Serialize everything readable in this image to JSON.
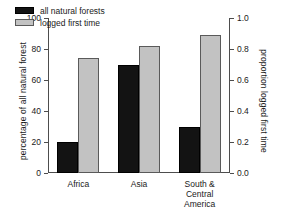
{
  "chart_data": {
    "type": "bar",
    "title": "",
    "categories": [
      "Africa",
      "Asia",
      "South &\nCentral America"
    ],
    "series": [
      {
        "name": "all natural forests",
        "color": "#131313",
        "values": [
          20,
          70,
          30
        ]
      },
      {
        "name": "logged first time",
        "color": "#c2c2c2",
        "values": [
          74,
          82,
          89
        ]
      }
    ],
    "xlabel": "",
    "ylabel": "percentage of all natural forest",
    "ylabel_right": "proportion logged first time",
    "ylim": [
      0,
      100
    ],
    "ylim_right": [
      0.0,
      1.0
    ],
    "yticks": [
      "0",
      "20",
      "40",
      "60",
      "80",
      "100"
    ],
    "ytick_values": [
      0,
      20,
      40,
      60,
      80,
      100
    ],
    "yticks_right": [
      "0.0",
      "0.2",
      "0.4",
      "0.6",
      "0.8",
      "1.0"
    ],
    "ytick_values_right": [
      0.0,
      0.2,
      0.4,
      0.6,
      0.8,
      1.0
    ],
    "grid": false,
    "legend_position": "upper left"
  },
  "axes": {
    "left_title": "percentage of all natural forest",
    "right_title": "proportion logged first time"
  },
  "legend": {
    "entries": [
      {
        "label": "all natural forests",
        "swatch": "dark"
      },
      {
        "label": "logged first time",
        "swatch": "light"
      }
    ]
  }
}
